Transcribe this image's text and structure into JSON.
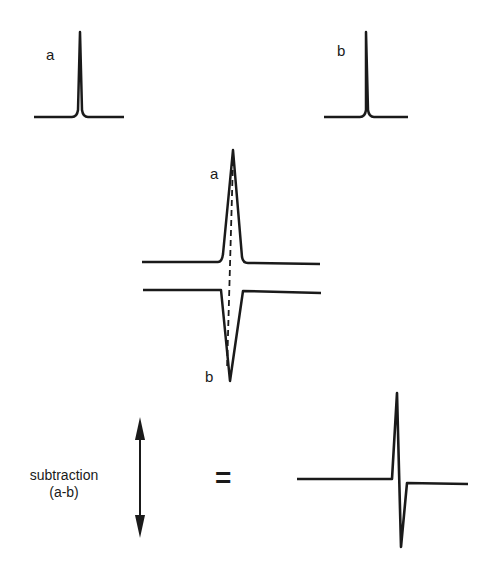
{
  "diagram": {
    "title": "",
    "panels": {
      "peak_a": {
        "label": "a"
      },
      "peak_b": {
        "label": "b"
      },
      "overlay": {
        "label_top": "a",
        "label_bottom": "b"
      },
      "operation": {
        "label_line1": "subtraction",
        "label_line2": "(a-b)",
        "equals": "="
      }
    },
    "colors": {
      "stroke": "#1a1a1a",
      "background": "#ffffff"
    }
  }
}
